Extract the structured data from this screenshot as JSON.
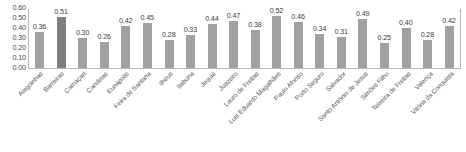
{
  "chart_data": {
    "type": "bar",
    "title": "",
    "subtitle": "",
    "xlabel": "",
    "ylabel": "",
    "ylim": [
      0.0,
      0.6
    ],
    "grid": false,
    "legend": null,
    "y_ticks": [
      "0.60",
      "0.50",
      "0.40",
      "0.30",
      "0.20",
      "0.10",
      "0.00"
    ],
    "y_tick_values": [
      0.6,
      0.5,
      0.4,
      0.3,
      0.2,
      0.1,
      0.0
    ],
    "categories": [
      "Alagoinhas",
      "Barreiras",
      "Camaçari",
      "Candeias",
      "Eunápolis",
      "Feira de Santana",
      "Ilhéus",
      "Itabuna",
      "Jequié",
      "Juazeiro",
      "Lauro de Freitas",
      "Luis Eduardo Magalhães",
      "Paulo Afonso",
      "Porto Seguro",
      "Salvador",
      "Santo Antônio de Jesus",
      "Simões Filho",
      "Teixeira de Freitas",
      "Valença",
      "Vitória da Conquista"
    ],
    "values": [
      0.36,
      0.51,
      0.3,
      0.26,
      0.42,
      0.45,
      0.28,
      0.33,
      0.44,
      0.47,
      0.38,
      0.52,
      0.46,
      0.34,
      0.31,
      0.49,
      0.25,
      0.4,
      0.28,
      0.42
    ],
    "data_labels": [
      "0.36",
      "0.51",
      "0.30",
      "0.26",
      "0.42",
      "0.45",
      "0.28",
      "0.33",
      "0.44",
      "0.47",
      "0.38",
      "0.52",
      "0.46",
      "0.34",
      "0.31",
      "0.49",
      "0.25",
      "0.40",
      "0.28",
      "0.42"
    ],
    "highlighted_index": 1,
    "colors": {
      "bar": "#a0a0a0",
      "bar_highlight": "#7d7d7d",
      "axis": "#b8b8b8",
      "label_text": "#555555",
      "value_text": "#3d3d3d"
    }
  }
}
